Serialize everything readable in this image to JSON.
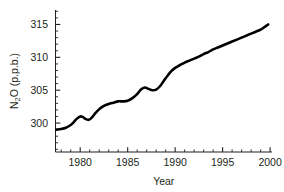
{
  "chart_data": {
    "type": "line",
    "title": "",
    "xlabel": "Year",
    "ylabel": "N2O (p.p.b.)",
    "ylabel_parts": {
      "pre": "N",
      "sub": "2",
      "post": "O (p.p.b.)"
    },
    "xlim": [
      1977.4,
      2000.2
    ],
    "ylim": [
      295.6,
      317.2
    ],
    "xticks": [
      1980,
      1985,
      1990,
      1995,
      2000
    ],
    "xtick_labels": [
      "1980",
      "1985",
      "1990",
      "1995",
      "2000"
    ],
    "xminor_step": 1,
    "yticks": [
      300,
      305,
      310,
      315
    ],
    "ytick_labels": [
      "300",
      "305",
      "310",
      "315"
    ],
    "yminor_step": 1,
    "grid": false,
    "legend": null,
    "line_color": "#000000",
    "line_width": 2.6,
    "axis_color": "#231f20",
    "series": [
      {
        "name": "N2O concentration",
        "x": [
          1977.5,
          1978.0,
          1978.5,
          1979.0,
          1979.3,
          1979.6,
          1980.0,
          1980.3,
          1980.6,
          1980.9,
          1981.2,
          1981.6,
          1982.0,
          1982.5,
          1983.0,
          1983.5,
          1984.0,
          1984.5,
          1985.0,
          1985.5,
          1986.0,
          1986.4,
          1986.8,
          1987.2,
          1987.6,
          1988.0,
          1988.4,
          1988.8,
          1989.2,
          1989.6,
          1990.0,
          1990.5,
          1991.0,
          1991.5,
          1992.0,
          1992.5,
          1993.0,
          1993.5,
          1994.0,
          1994.5,
          1995.0,
          1995.5,
          1996.0,
          1996.5,
          1997.0,
          1997.5,
          1998.0,
          1998.5,
          1999.0,
          1999.4,
          1999.8
        ],
        "y": [
          299.0,
          299.1,
          299.3,
          299.7,
          300.1,
          300.6,
          301.0,
          300.9,
          300.6,
          300.5,
          300.8,
          301.5,
          302.1,
          302.6,
          302.9,
          303.1,
          303.3,
          303.3,
          303.4,
          303.8,
          304.4,
          305.1,
          305.4,
          305.2,
          305.0,
          305.1,
          305.6,
          306.4,
          307.2,
          307.9,
          308.4,
          308.8,
          309.2,
          309.5,
          309.8,
          310.1,
          310.5,
          310.8,
          311.2,
          311.5,
          311.8,
          312.1,
          312.4,
          312.7,
          313.0,
          313.3,
          313.6,
          313.9,
          314.2,
          314.6,
          315.0
        ]
      }
    ]
  }
}
